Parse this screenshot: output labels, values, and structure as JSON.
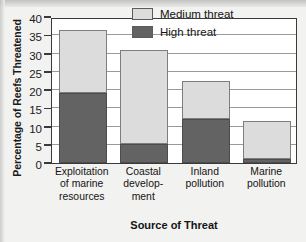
{
  "chart_data": {
    "type": "bar",
    "subtype": "stacked-bar",
    "title": "",
    "xlabel": "Source of Threat",
    "ylabel": "Percentage of Reefs Threatened",
    "categories": [
      "Exploitation of marine resources",
      "Coastal development",
      "Inland pollution",
      "Marine pollution"
    ],
    "category_lines": [
      [
        "Exploitation",
        "of marine",
        "resources"
      ],
      [
        "Coastal",
        "develop-",
        "ment"
      ],
      [
        "Inland",
        "pollution"
      ],
      [
        "Marine",
        "pollution"
      ]
    ],
    "series": [
      {
        "name": "High threat",
        "color": "#636363",
        "values": [
          19.3,
          5.2,
          12.0,
          1.0
        ]
      },
      {
        "name": "Medium threat",
        "color": "#dcdcdc",
        "values": [
          17.2,
          25.8,
          10.5,
          10.4
        ]
      }
    ],
    "totals": [
      36.5,
      31.0,
      22.5,
      11.4
    ],
    "ylim": [
      0,
      40
    ],
    "yticks": [
      0,
      5,
      10,
      15,
      20,
      25,
      30,
      35,
      40
    ],
    "ytick_labels": [
      "0",
      "5",
      "10",
      "15",
      "20",
      "25",
      "30",
      "35",
      "40"
    ],
    "grid": true,
    "legend_position": "top-right",
    "legend_entries": [
      "Medium threat",
      "High threat"
    ]
  },
  "legend": {
    "medium_label": "Medium threat",
    "high_label": "High threat"
  },
  "axes": {
    "y_title": "Percentage of Reefs Threatened",
    "x_title": "Source of Threat"
  }
}
